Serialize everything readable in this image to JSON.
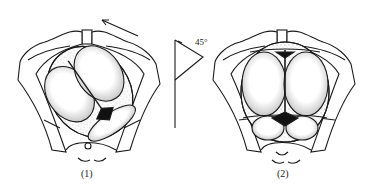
{
  "figure": {
    "panels": [
      {
        "id": "panel-1",
        "label": "(1)",
        "description": "Fetal head in pelvis, oblique position before internal rotation"
      },
      {
        "id": "panel-2",
        "label": "(2)",
        "description": "Fetal head in pelvis after 45 degree internal rotation, sagittal suture anteroposterior"
      }
    ],
    "rotation_indicator": {
      "angle_label": "45°"
    },
    "colors": {
      "ink": "#1a1a1a",
      "fill": "#ffffff",
      "stipple": "#555555"
    }
  }
}
